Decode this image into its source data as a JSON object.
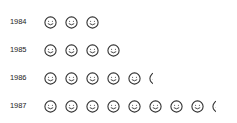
{
  "chart_data": {
    "type": "pictogram",
    "title": "",
    "xlabel": "",
    "ylabel": "",
    "icon": "smiley-face-icon",
    "icon_color": "#333333",
    "categories": [
      "1984",
      "1985",
      "1986",
      "1987"
    ],
    "values": [
      3,
      4,
      5.3,
      8.3
    ],
    "legend": []
  },
  "rows": [
    {
      "label": "1984",
      "value": 3
    },
    {
      "label": "1985",
      "value": 4
    },
    {
      "label": "1986",
      "value": 5.3
    },
    {
      "label": "1987",
      "value": 8.3
    }
  ]
}
